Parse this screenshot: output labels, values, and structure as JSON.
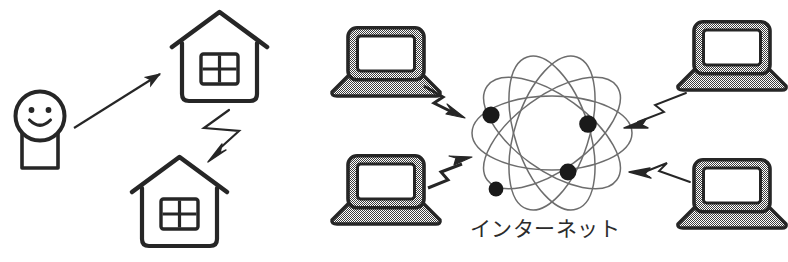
{
  "figure": {
    "kind": "illustration",
    "title_text": "",
    "background_color": "#ffffff",
    "width": 788,
    "height": 262
  },
  "colors": {
    "ink": "#262626",
    "ink_soft": "#3a3a3a",
    "orbit_stroke": "#6d6d6d",
    "laptop_fill": "#8f8f8f",
    "laptop_border": "#262626",
    "screen_fill": "#ffffff",
    "node_fill": "#1a1a1a",
    "paper": "#ffffff"
  },
  "left_scene": {
    "name": "home-to-home-wireless",
    "person": {
      "label": "person",
      "face": "smiley-face",
      "head_cx": 40,
      "head_cy": 118,
      "head_r": 24
    },
    "arrow_person_to_house": {
      "label": "straight-arrow",
      "from": [
        72,
        126
      ],
      "to": [
        166,
        69
      ],
      "style": "thin-solid-filled-head"
    },
    "house_top": {
      "label": "house-upper",
      "x": 175,
      "y": 12,
      "w": 95,
      "h": 92,
      "window_panes": 4
    },
    "house_bottom": {
      "label": "house-lower",
      "x": 135,
      "y": 155,
      "w": 95,
      "h": 92,
      "window_panes": 4
    },
    "bolt": {
      "label": "lightning-bolt-arrow",
      "style": "hollow-zigzag-filled-head",
      "direction": "down-left"
    }
  },
  "right_scene": {
    "name": "laptops-to-internet",
    "internet_label": "インターネット",
    "internet_label_pos": [
      545,
      232
    ],
    "cloud": {
      "label": "internet-atom",
      "cx": 552,
      "cy": 133,
      "orbit_count": 5,
      "orbit_rx": 78,
      "orbit_ry": 36,
      "orbit_rotations": [
        0,
        36,
        72,
        108,
        144
      ],
      "nodes": [
        {
          "name": "node-upper-left",
          "cx": 491,
          "cy": 115,
          "r": 8
        },
        {
          "name": "node-upper-right",
          "cx": 588,
          "cy": 124,
          "r": 8
        },
        {
          "name": "node-lower-right",
          "cx": 568,
          "cy": 172,
          "r": 8
        },
        {
          "name": "node-lower-left",
          "cx": 496,
          "cy": 189,
          "r": 7
        }
      ]
    },
    "laptops": [
      {
        "name": "laptop-top-left",
        "position": "top-left",
        "x": 330,
        "y": 28,
        "w": 96,
        "h": 74,
        "connector": {
          "name": "bolt-top-left",
          "style": "filled-zigzag",
          "direction": "to-internet",
          "points": "424,88 440,98 432,105 470,120"
        }
      },
      {
        "name": "laptop-bottom-left",
        "position": "bottom-left",
        "x": 330,
        "y": 155,
        "w": 96,
        "h": 74,
        "connector": {
          "name": "bolt-bottom-left",
          "style": "filled-zigzag",
          "direction": "to-internet",
          "points": "428,186 446,178 440,172 474,157"
        }
      },
      {
        "name": "laptop-top-right",
        "position": "top-right",
        "x": 678,
        "y": 22,
        "w": 96,
        "h": 74,
        "connector": {
          "name": "bolt-top-right",
          "style": "hollow-zigzag",
          "direction": "to-internet",
          "points": "676,95 650,106 658,113 626,126"
        }
      },
      {
        "name": "laptop-bottom-right",
        "position": "bottom-right",
        "x": 678,
        "y": 160,
        "w": 96,
        "h": 74,
        "connector": {
          "name": "bolt-bottom-right",
          "style": "hollow-zigzag",
          "direction": "to-internet",
          "points": "680,182 656,172 663,164 632,176"
        }
      }
    ]
  }
}
